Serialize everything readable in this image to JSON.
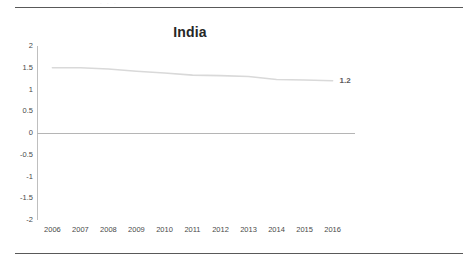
{
  "page": {
    "faint_header_text": "·   ·   ·"
  },
  "chart_data": {
    "type": "line",
    "title": "India",
    "xlabel": "",
    "ylabel": "",
    "categories": [
      "2006",
      "2007",
      "2008",
      "2009",
      "2010",
      "2011",
      "2012",
      "2013",
      "2014",
      "2015",
      "2016"
    ],
    "series": [
      {
        "name": "India",
        "values": [
          1.5,
          1.5,
          1.47,
          1.42,
          1.38,
          1.33,
          1.32,
          1.3,
          1.23,
          1.22,
          1.2
        ],
        "color": "#d9d9d9",
        "end_label": "1.2"
      }
    ],
    "y_ticks": [
      "2",
      "1.5",
      "1",
      "0.5",
      "0",
      "-0.5",
      "-1",
      "-1.5",
      "-2"
    ],
    "y_tick_values": [
      2,
      1.5,
      1,
      0.5,
      0,
      -0.5,
      -1,
      -1.5,
      -2
    ],
    "ylim": [
      -2,
      2
    ],
    "grid": false,
    "legend": "none",
    "zero_line_color": "#b5b5b5",
    "axis_color": "#bfbfbf"
  }
}
